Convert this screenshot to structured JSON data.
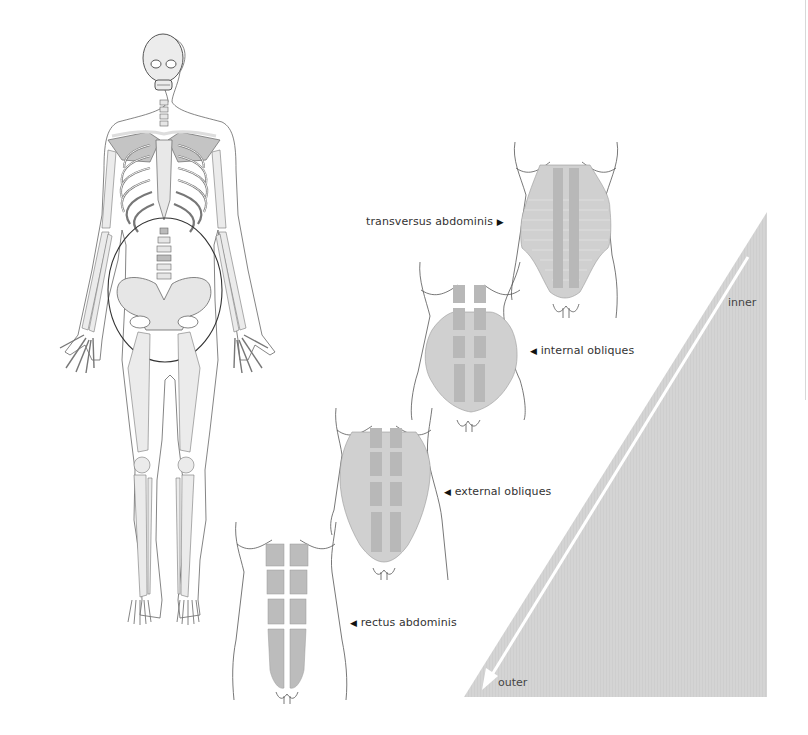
{
  "diagram": {
    "skeleton": {
      "highlight": "pelvic/abdominal region circled"
    },
    "layers": [
      {
        "id": "transversus",
        "label": "transversus abdominis",
        "arrow": "▶",
        "arrow_side": "right",
        "depth": "inner"
      },
      {
        "id": "internal",
        "label": "internal obliques",
        "arrow": "◀",
        "arrow_side": "left"
      },
      {
        "id": "external",
        "label": "external obliques",
        "arrow": "◀",
        "arrow_side": "left"
      },
      {
        "id": "rectus",
        "label": "rectus abdominis",
        "arrow": "◀",
        "arrow_side": "left",
        "depth": "outer"
      }
    ],
    "gradient": {
      "top_label": "inner",
      "bottom_label": "outer",
      "fill": "#d6d6d6",
      "arrow_color": "#ffffff"
    },
    "colors": {
      "line": "#555555",
      "bone": "#ebebeb",
      "bone_dark": "#c4c4c4",
      "muscle": "#c8c8c8"
    }
  }
}
